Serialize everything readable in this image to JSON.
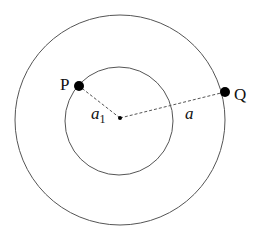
{
  "diagram": {
    "type": "concentric-orbits",
    "center": {
      "x": 120,
      "y": 118
    },
    "outer_circle": {
      "r": 105,
      "stroke": "#555555"
    },
    "inner_circle": {
      "r": 54,
      "stroke": "#555555"
    },
    "points": [
      {
        "id": "P",
        "label": "P",
        "x": 79,
        "y": 86
      },
      {
        "id": "Q",
        "label": "Q",
        "x": 225,
        "y": 92
      }
    ],
    "radii": [
      {
        "to": "P",
        "label_main": "a",
        "label_sub": "1"
      },
      {
        "to": "Q",
        "label_main": "a",
        "label_sub": ""
      }
    ],
    "colors": {
      "line": "#555555",
      "point": "#000000",
      "text": "#111111"
    }
  }
}
